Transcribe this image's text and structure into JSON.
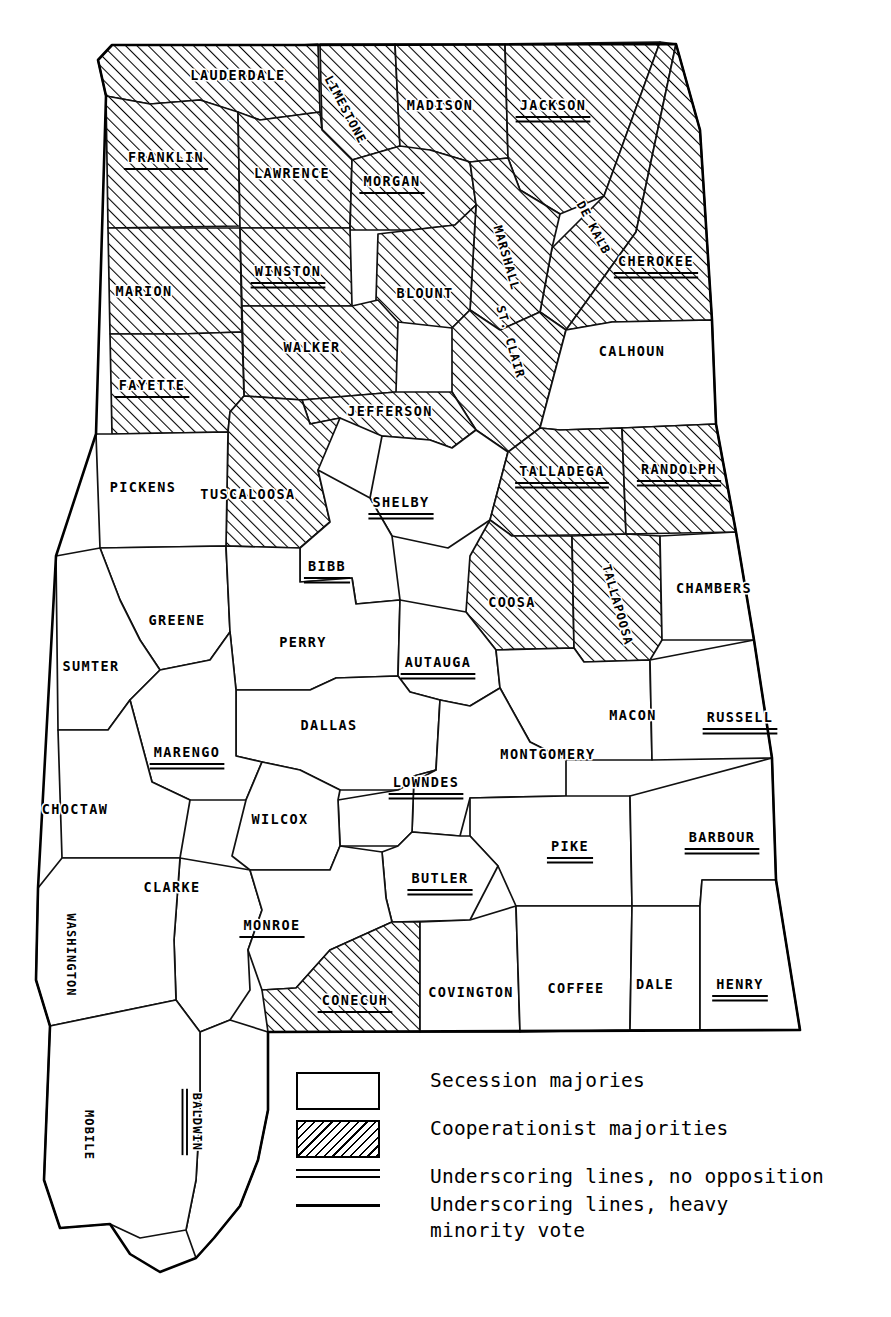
{
  "map": {
    "title": "Alabama county vote on secession",
    "state": "Alabama",
    "ink_color": "#000000",
    "paper_color": "#ffffff"
  },
  "legend": {
    "items": [
      {
        "swatch": "empty-box",
        "label": "Secession majories"
      },
      {
        "swatch": "hatched-box",
        "label": "Cooperationist majorities"
      },
      {
        "swatch": "double-rule",
        "label": "Underscoring lines, no opposition"
      },
      {
        "swatch": "single-rule",
        "label": "Underscoring lines, heavy\nminority vote"
      }
    ]
  },
  "counties": [
    {
      "name": "LAUDERDALE",
      "fill": "hatched",
      "underline": "none",
      "x": 238,
      "y": 76,
      "rot": 0,
      "size": "normal"
    },
    {
      "name": "LIMESTONE",
      "fill": "hatched",
      "underline": "none",
      "x": 345,
      "y": 110,
      "rot": 62,
      "size": "small"
    },
    {
      "name": "MADISON",
      "fill": "hatched",
      "underline": "none",
      "x": 440,
      "y": 106,
      "rot": 0,
      "size": "normal"
    },
    {
      "name": "JACKSON",
      "fill": "hatched",
      "underline": "double",
      "x": 553,
      "y": 106,
      "rot": 0,
      "size": "normal"
    },
    {
      "name": "FRANKLIN",
      "fill": "hatched",
      "underline": "single",
      "x": 166,
      "y": 158,
      "rot": 0,
      "size": "normal"
    },
    {
      "name": "LAWRENCE",
      "fill": "hatched",
      "underline": "none",
      "x": 292,
      "y": 174,
      "rot": 0,
      "size": "normal"
    },
    {
      "name": "MORGAN",
      "fill": "hatched",
      "underline": "single",
      "x": 392,
      "y": 182,
      "rot": 0,
      "size": "normal"
    },
    {
      "name": "MARSHALL",
      "fill": "hatched",
      "underline": "none",
      "x": 506,
      "y": 258,
      "rot": 74,
      "size": "small"
    },
    {
      "name": "DE KALB",
      "fill": "hatched",
      "underline": "none",
      "x": 593,
      "y": 228,
      "rot": 62,
      "size": "small"
    },
    {
      "name": "CHEROKEE",
      "fill": "hatched",
      "underline": "double",
      "x": 656,
      "y": 262,
      "rot": 0,
      "size": "normal"
    },
    {
      "name": "MARION",
      "fill": "hatched",
      "underline": "none",
      "x": 144,
      "y": 292,
      "rot": 0,
      "size": "normal"
    },
    {
      "name": "WINSTON",
      "fill": "hatched",
      "underline": "double",
      "x": 288,
      "y": 272,
      "rot": 0,
      "size": "normal"
    },
    {
      "name": "BLOUNT",
      "fill": "hatched",
      "underline": "none",
      "x": 425,
      "y": 294,
      "rot": 0,
      "size": "normal"
    },
    {
      "name": "WALKER",
      "fill": "hatched",
      "underline": "none",
      "x": 312,
      "y": 348,
      "rot": 0,
      "size": "normal"
    },
    {
      "name": "ST. CLAIR",
      "fill": "hatched",
      "underline": "none",
      "x": 510,
      "y": 342,
      "rot": 74,
      "size": "small"
    },
    {
      "name": "CALHOUN",
      "fill": "plain",
      "underline": "none",
      "x": 632,
      "y": 352,
      "rot": 0,
      "size": "normal"
    },
    {
      "name": "FAYETTE",
      "fill": "hatched",
      "underline": "single",
      "x": 152,
      "y": 386,
      "rot": 0,
      "size": "normal"
    },
    {
      "name": "JEFFERSON",
      "fill": "hatched",
      "underline": "none",
      "x": 390,
      "y": 412,
      "rot": 0,
      "size": "normal"
    },
    {
      "name": "TALLADEGA",
      "fill": "hatched",
      "underline": "double",
      "x": 562,
      "y": 472,
      "rot": 0,
      "size": "normal"
    },
    {
      "name": "RANDOLPH",
      "fill": "hatched",
      "underline": "double",
      "x": 679,
      "y": 470,
      "rot": 0,
      "size": "normal"
    },
    {
      "name": "PICKENS",
      "fill": "plain",
      "underline": "none",
      "x": 143,
      "y": 488,
      "rot": 0,
      "size": "normal"
    },
    {
      "name": "TUSCALOOSA",
      "fill": "hatched",
      "underline": "none",
      "x": 248,
      "y": 495,
      "rot": 0,
      "size": "normal"
    },
    {
      "name": "SHELBY",
      "fill": "plain",
      "underline": "double",
      "x": 401,
      "y": 503,
      "rot": 0,
      "size": "normal"
    },
    {
      "name": "BIBB",
      "fill": "plain",
      "underline": "double",
      "x": 327,
      "y": 567,
      "rot": 0,
      "size": "normal"
    },
    {
      "name": "COOSA",
      "fill": "hatched",
      "underline": "none",
      "x": 512,
      "y": 603,
      "rot": 0,
      "size": "normal"
    },
    {
      "name": "TALLAPOOSA",
      "fill": "hatched",
      "underline": "none",
      "x": 617,
      "y": 605,
      "rot": 74,
      "size": "small"
    },
    {
      "name": "CHAMBERS",
      "fill": "plain",
      "underline": "none",
      "x": 714,
      "y": 589,
      "rot": 0,
      "size": "normal"
    },
    {
      "name": "GREENE",
      "fill": "plain",
      "underline": "none",
      "x": 177,
      "y": 621,
      "rot": 0,
      "size": "normal"
    },
    {
      "name": "PERRY",
      "fill": "plain",
      "underline": "none",
      "x": 303,
      "y": 643,
      "rot": 0,
      "size": "normal"
    },
    {
      "name": "AUTAUGA",
      "fill": "plain",
      "underline": "double",
      "x": 438,
      "y": 663,
      "rot": 0,
      "size": "normal"
    },
    {
      "name": "SUMTER",
      "fill": "plain",
      "underline": "none",
      "x": 91,
      "y": 667,
      "rot": 0,
      "size": "normal"
    },
    {
      "name": "DALLAS",
      "fill": "plain",
      "underline": "none",
      "x": 329,
      "y": 726,
      "rot": 0,
      "size": "normal"
    },
    {
      "name": "MACON",
      "fill": "plain",
      "underline": "none",
      "x": 633,
      "y": 716,
      "rot": 0,
      "size": "normal"
    },
    {
      "name": "RUSSELL",
      "fill": "plain",
      "underline": "double",
      "x": 740,
      "y": 718,
      "rot": 0,
      "size": "normal"
    },
    {
      "name": "MARENGO",
      "fill": "plain",
      "underline": "double",
      "x": 187,
      "y": 753,
      "rot": 0,
      "size": "normal"
    },
    {
      "name": "MONTGOMERY",
      "fill": "plain",
      "underline": "none",
      "x": 548,
      "y": 755,
      "rot": 0,
      "size": "normal"
    },
    {
      "name": "LOWNDES",
      "fill": "plain",
      "underline": "double",
      "x": 426,
      "y": 783,
      "rot": 0,
      "size": "normal"
    },
    {
      "name": "CHOCTAW",
      "fill": "plain",
      "underline": "none",
      "x": 75,
      "y": 810,
      "rot": 0,
      "size": "normal"
    },
    {
      "name": "WILCOX",
      "fill": "plain",
      "underline": "none",
      "x": 280,
      "y": 820,
      "rot": 0,
      "size": "normal"
    },
    {
      "name": "PIKE",
      "fill": "plain",
      "underline": "double",
      "x": 570,
      "y": 847,
      "rot": 0,
      "size": "normal"
    },
    {
      "name": "BARBOUR",
      "fill": "plain",
      "underline": "double",
      "x": 722,
      "y": 838,
      "rot": 0,
      "size": "normal"
    },
    {
      "name": "CLARKE",
      "fill": "plain",
      "underline": "none",
      "x": 172,
      "y": 888,
      "rot": 0,
      "size": "normal"
    },
    {
      "name": "BUTLER",
      "fill": "plain",
      "underline": "double",
      "x": 440,
      "y": 879,
      "rot": 0,
      "size": "normal"
    },
    {
      "name": "MONROE",
      "fill": "plain",
      "underline": "single",
      "x": 272,
      "y": 926,
      "rot": 0,
      "size": "normal"
    },
    {
      "name": "WASHINGTON",
      "fill": "plain",
      "underline": "none",
      "x": 70,
      "y": 955,
      "rot": 90,
      "size": "small"
    },
    {
      "name": "COVINGTON",
      "fill": "plain",
      "underline": "none",
      "x": 471,
      "y": 993,
      "rot": 0,
      "size": "normal"
    },
    {
      "name": "COFFEE",
      "fill": "plain",
      "underline": "none",
      "x": 576,
      "y": 989,
      "rot": 0,
      "size": "normal"
    },
    {
      "name": "DALE",
      "fill": "plain",
      "underline": "none",
      "x": 655,
      "y": 985,
      "rot": 0,
      "size": "normal"
    },
    {
      "name": "HENRY",
      "fill": "plain",
      "underline": "double",
      "x": 740,
      "y": 985,
      "rot": 0,
      "size": "normal"
    },
    {
      "name": "CONECUH",
      "fill": "hatched",
      "underline": "single",
      "x": 355,
      "y": 1001,
      "rot": 0,
      "size": "normal"
    },
    {
      "name": "MOBILE",
      "fill": "plain",
      "underline": "none",
      "x": 88,
      "y": 1135,
      "rot": 90,
      "size": "small"
    },
    {
      "name": "BALDWIN",
      "fill": "plain",
      "underline": "double",
      "x": 196,
      "y": 1122,
      "rot": 90,
      "size": "small"
    }
  ]
}
